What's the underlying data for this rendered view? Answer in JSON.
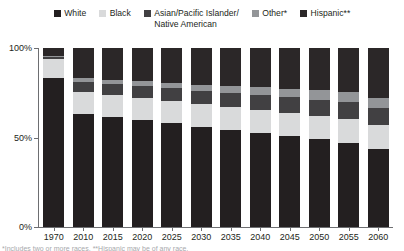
{
  "legend": {
    "items": [
      {
        "label": "White",
        "color": "#231f20",
        "icon": "square-swatch-icon"
      },
      {
        "label": "Black",
        "color": "#d9dadb",
        "icon": "square-swatch-icon"
      },
      {
        "label": "Asian/Pacific Islander/\nNative American",
        "color": "#414042",
        "icon": "square-swatch-icon"
      },
      {
        "label": "Other*",
        "color": "#939598",
        "icon": "square-swatch-icon"
      },
      {
        "label": "Hispanic**",
        "color": "#2b2728",
        "icon": "square-swatch-icon"
      }
    ]
  },
  "axes": {
    "y_ticks": [
      {
        "value": 100,
        "label": "100%"
      },
      {
        "value": 50,
        "label": "50%"
      },
      {
        "value": 0,
        "label": "0%"
      }
    ],
    "y_min": 0,
    "y_max": 100
  },
  "footnote": "*Includes two or more races.  **Hispanic may be of any race.",
  "chart_data": {
    "type": "bar",
    "stacked": true,
    "title": "",
    "xlabel": "",
    "ylabel": "",
    "ylim": [
      0,
      100
    ],
    "grid": false,
    "legend_position": "top",
    "categories": [
      "1970",
      "2010",
      "2015",
      "2020",
      "2025",
      "2030",
      "2035",
      "2040",
      "2045",
      "2050",
      "2055",
      "2060"
    ],
    "series": [
      {
        "name": "White",
        "color": "#231f20",
        "values": [
          83.2,
          63.0,
          61.4,
          59.7,
          58.0,
          56.0,
          54.3,
          52.6,
          50.8,
          49.0,
          47.1,
          43.6
        ]
      },
      {
        "name": "Black",
        "color": "#d9dadb",
        "values": [
          10.7,
          12.2,
          12.3,
          12.4,
          12.5,
          12.6,
          12.7,
          12.8,
          12.9,
          13.0,
          13.1,
          13.2
        ]
      },
      {
        "name": "Asian/Pacific Islander/Native American",
        "color": "#414042",
        "values": [
          1.0,
          5.6,
          6.0,
          6.5,
          7.0,
          7.4,
          7.9,
          8.3,
          8.7,
          9.1,
          9.4,
          9.7
        ]
      },
      {
        "name": "Other*",
        "color": "#939598",
        "values": [
          0.9,
          2.2,
          2.5,
          2.8,
          3.2,
          3.6,
          4.0,
          4.4,
          4.8,
          5.2,
          5.6,
          5.7
        ]
      },
      {
        "name": "Hispanic**",
        "color": "#2b2728",
        "values": [
          4.2,
          17.0,
          17.8,
          18.6,
          19.3,
          20.4,
          21.1,
          21.9,
          22.8,
          23.7,
          24.8,
          27.8
        ]
      }
    ]
  }
}
